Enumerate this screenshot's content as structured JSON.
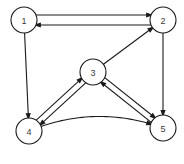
{
  "figure": {
    "background_color": "#ffffff",
    "stroke_color": "#1a1a1a",
    "label_color": "#3a3a3a",
    "width": 184,
    "height": 164
  },
  "chart_data": {
    "type": "diagram",
    "diagram_kind": "directed-graph",
    "title": "",
    "node_radius": 13,
    "nodes": [
      {
        "id": "1",
        "label": "1",
        "x": 24,
        "y": 20
      },
      {
        "id": "2",
        "label": "2",
        "x": 163,
        "y": 20
      },
      {
        "id": "3",
        "label": "3",
        "x": 93,
        "y": 72
      },
      {
        "id": "4",
        "label": "4",
        "x": 29,
        "y": 131
      },
      {
        "id": "5",
        "label": "5",
        "x": 163,
        "y": 128
      }
    ],
    "edges": [
      {
        "from": "1",
        "to": "2",
        "style": "straight",
        "offset": -5,
        "directed": true
      },
      {
        "from": "2",
        "to": "1",
        "style": "straight",
        "offset": -5,
        "directed": true
      },
      {
        "from": "1",
        "to": "4",
        "style": "straight",
        "offset": 0,
        "directed": true
      },
      {
        "from": "3",
        "to": "2",
        "style": "straight",
        "offset": 0,
        "directed": true
      },
      {
        "from": "2",
        "to": "5",
        "style": "straight",
        "offset": 0,
        "directed": true
      },
      {
        "from": "3",
        "to": "4",
        "style": "straight",
        "offset": -3,
        "directed": true
      },
      {
        "from": "4",
        "to": "3",
        "style": "straight",
        "offset": -3,
        "directed": true
      },
      {
        "from": "3",
        "to": "5",
        "style": "straight",
        "offset": -3,
        "directed": true
      },
      {
        "from": "5",
        "to": "3",
        "style": "straight",
        "offset": -3,
        "directed": true
      },
      {
        "from": "4",
        "to": "5",
        "style": "curved",
        "curvature": 26,
        "directed": true
      }
    ]
  }
}
